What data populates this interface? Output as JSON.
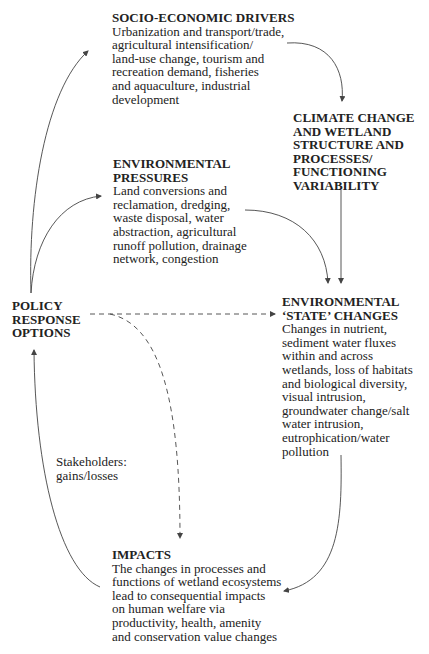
{
  "nodes": {
    "socio_economic": {
      "title": "SOCIO-ECONOMIC DRIVERS",
      "body": "Urbanization and transport/trade,\nagricultural intensification/\nland-use change, tourism and\nrecreation demand, fisheries\nand aquaculture, industrial\ndevelopment"
    },
    "climate": {
      "title": "CLIMATE CHANGE\nAND WETLAND\nSTRUCTURE AND\nPROCESSES/\nFUNCTIONING\nVARIABILITY"
    },
    "pressures": {
      "title": "ENVIRONMENTAL\nPRESSURES",
      "body": "Land conversions and\nreclamation, dredging,\nwaste disposal, water\nabstraction, agricultural\nrunoff pollution, drainage\nnetwork, congestion"
    },
    "policy": {
      "title": "POLICY\nRESPONSE\nOPTIONS"
    },
    "state_changes": {
      "title": "ENVIRONMENTAL\n‘STATE’ CHANGES",
      "body": "Changes in nutrient,\nsediment water fluxes\nwithin and across\nwetlands, loss of habitats\nand biological diversity,\nvisual intrusion,\ngroundwater change/salt\nwater intrusion,\neutrophication/water\npollution"
    },
    "impacts": {
      "title": "IMPACTS",
      "body": "The changes in processes and\nfunctions of wetland ecosystems\nlead to consequential impacts\non human welfare via\nproductivity, health, amenity\nand conservation value changes"
    }
  },
  "edge_labels": {
    "stakeholders": "Stakeholders:\ngains/losses"
  },
  "edges": [
    {
      "from": "policy",
      "to": "socio_economic",
      "style": "solid"
    },
    {
      "from": "policy",
      "to": "pressures",
      "style": "solid"
    },
    {
      "from": "socio_economic",
      "to": "climate",
      "style": "solid"
    },
    {
      "from": "climate",
      "to": "state_changes",
      "style": "solid"
    },
    {
      "from": "pressures",
      "to": "state_changes",
      "style": "solid"
    },
    {
      "from": "policy",
      "to": "state_changes",
      "style": "dashed"
    },
    {
      "from": "policy",
      "to": "impacts",
      "style": "dashed"
    },
    {
      "from": "state_changes",
      "to": "impacts",
      "style": "solid"
    },
    {
      "from": "impacts",
      "to": "policy",
      "style": "solid",
      "label": "Stakeholders: gains/losses"
    }
  ],
  "colors": {
    "text": "#222222",
    "arrow": "#444444",
    "background": "#ffffff"
  }
}
